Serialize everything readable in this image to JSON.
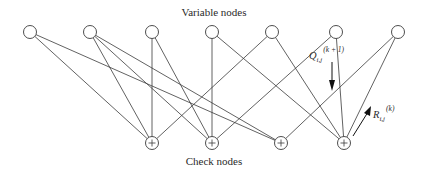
{
  "diagram": {
    "type": "tanner-graph",
    "title_top": "Variable nodes",
    "title_bottom": "Check nodes",
    "colors": {
      "stroke": "#3a3a3a",
      "background": "#ffffff",
      "text": "#2a2a2a"
    },
    "variable_nodes": [
      {
        "id": "v1",
        "x": 30,
        "y": 32
      },
      {
        "id": "v2",
        "x": 90,
        "y": 32
      },
      {
        "id": "v3",
        "x": 152,
        "y": 32
      },
      {
        "id": "v4",
        "x": 212,
        "y": 32
      },
      {
        "id": "v5",
        "x": 272,
        "y": 32
      },
      {
        "id": "v6",
        "x": 336,
        "y": 32
      },
      {
        "id": "v7",
        "x": 398,
        "y": 32
      }
    ],
    "check_nodes": [
      {
        "id": "c1",
        "x": 152,
        "y": 143,
        "symbol": "+"
      },
      {
        "id": "c2",
        "x": 212,
        "y": 143,
        "symbol": "+"
      },
      {
        "id": "c3",
        "x": 281,
        "y": 143,
        "symbol": "+"
      },
      {
        "id": "c4",
        "x": 344,
        "y": 143,
        "symbol": "+"
      }
    ],
    "edges": [
      [
        "v1",
        "c1"
      ],
      [
        "v1",
        "c3"
      ],
      [
        "v2",
        "c1"
      ],
      [
        "v2",
        "c2"
      ],
      [
        "v2",
        "c3"
      ],
      [
        "v3",
        "c1"
      ],
      [
        "v3",
        "c2"
      ],
      [
        "v4",
        "c2"
      ],
      [
        "v4",
        "c4"
      ],
      [
        "v5",
        "c1"
      ],
      [
        "v5",
        "c4"
      ],
      [
        "v6",
        "c2"
      ],
      [
        "v6",
        "c4"
      ],
      [
        "v7",
        "c3"
      ],
      [
        "v7",
        "c4"
      ]
    ],
    "messages": {
      "q": {
        "symbol": "Q",
        "subscript": "i,j",
        "superscript": "(k + 1)",
        "direction": "down"
      },
      "r": {
        "symbol": "R",
        "subscript": "i,j",
        "superscript": "(k)",
        "direction": "up"
      }
    }
  }
}
